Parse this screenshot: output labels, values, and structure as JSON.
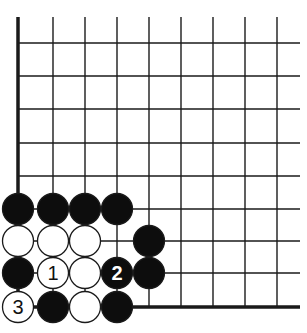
{
  "diagram": {
    "type": "go-board-corner",
    "colors": {
      "line": "#1a1a1a",
      "black_stone": "#0d0d0d",
      "white_stone": "#ffffff",
      "background": "#ffffff"
    },
    "grid": {
      "x_lines": [
        18,
        53,
        85,
        117,
        149,
        181,
        213,
        245,
        277
      ],
      "y_lines": [
        43,
        76,
        109,
        143,
        176,
        209,
        241,
        273,
        307
      ],
      "top_extent": 17,
      "right_extent": 300,
      "thick_left": true,
      "thick_bottom": true
    },
    "stones": [
      {
        "col": 0,
        "row": 5,
        "color": "black",
        "label": ""
      },
      {
        "col": 1,
        "row": 5,
        "color": "black",
        "label": ""
      },
      {
        "col": 2,
        "row": 5,
        "color": "black",
        "label": ""
      },
      {
        "col": 3,
        "row": 5,
        "color": "black",
        "label": ""
      },
      {
        "col": 0,
        "row": 6,
        "color": "white",
        "label": ""
      },
      {
        "col": 1,
        "row": 6,
        "color": "white",
        "label": ""
      },
      {
        "col": 2,
        "row": 6,
        "color": "white",
        "label": ""
      },
      {
        "col": 4,
        "row": 6,
        "color": "black",
        "label": ""
      },
      {
        "col": 0,
        "row": 7,
        "color": "black",
        "label": ""
      },
      {
        "col": 1,
        "row": 7,
        "color": "white",
        "label": "1"
      },
      {
        "col": 2,
        "row": 7,
        "color": "white",
        "label": ""
      },
      {
        "col": 3,
        "row": 7,
        "color": "black",
        "label": "2"
      },
      {
        "col": 4,
        "row": 7,
        "color": "black",
        "label": ""
      },
      {
        "col": 0,
        "row": 8,
        "color": "white",
        "label": "3"
      },
      {
        "col": 1,
        "row": 8,
        "color": "black",
        "label": ""
      },
      {
        "col": 2,
        "row": 8,
        "color": "white",
        "label": ""
      },
      {
        "col": 3,
        "row": 8,
        "color": "black",
        "label": ""
      }
    ]
  }
}
